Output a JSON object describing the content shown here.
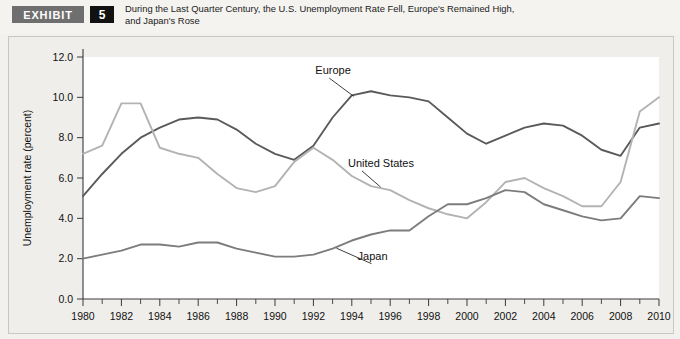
{
  "header": {
    "badge_label": "EXHIBIT",
    "exhibit_number": "5",
    "title_line1": "During the Last Quarter Century, the U.S. Unemployment Rate Fell, Europe's Remained High,",
    "title_line2": "and Japan's Rose"
  },
  "colors": {
    "europe": "#5a5a5a",
    "united_states": "#b3b3b3",
    "japan": "#7c7c7c",
    "axis": "#3a3a3a",
    "panel_bg": "#efeeea",
    "plot_bg": "#ffffff",
    "badge_gray": "#6f6f6f",
    "badge_black": "#111111"
  },
  "chart_data": {
    "type": "line",
    "title": "During the Last Quarter Century, the U.S. Unemployment Rate Fell, Europe's Remained High, and Japan's Rose",
    "xlabel": "",
    "ylabel": "Unemployment rate (percent)",
    "xlim": [
      1980,
      2010
    ],
    "ylim": [
      0.0,
      12.0
    ],
    "ytick_labels": [
      "0.0",
      "2.0",
      "4.0",
      "6.0",
      "8.0",
      "10.0",
      "12.0"
    ],
    "ytick_values": [
      0.0,
      2.0,
      4.0,
      6.0,
      8.0,
      10.0,
      12.0
    ],
    "xtick_labels": [
      "1980",
      "1982",
      "1984",
      "1986",
      "1988",
      "1990",
      "1992",
      "1994",
      "1996",
      "1998",
      "2000",
      "2002",
      "2004",
      "2006",
      "2008",
      "2010"
    ],
    "xtick_values": [
      1980,
      1982,
      1984,
      1986,
      1988,
      1990,
      1992,
      1994,
      1996,
      1998,
      2000,
      2002,
      2004,
      2006,
      2008,
      2010
    ],
    "x_minor_ticks": [
      1981,
      1983,
      1985,
      1987,
      1989,
      1991,
      1993,
      1995,
      1997,
      1999,
      2001,
      2003,
      2005,
      2007,
      2009
    ],
    "grid": false,
    "legend_position": "inline-annotations",
    "x": [
      1980,
      1981,
      1982,
      1983,
      1984,
      1985,
      1986,
      1987,
      1988,
      1989,
      1990,
      1991,
      1992,
      1993,
      1994,
      1995,
      1996,
      1997,
      1998,
      1999,
      2000,
      2001,
      2002,
      2003,
      2004,
      2005,
      2006,
      2007,
      2008,
      2009,
      2010
    ],
    "series": [
      {
        "name": "Europe",
        "color": "#5a5a5a",
        "values": [
          5.1,
          6.2,
          7.2,
          8.0,
          8.5,
          8.9,
          9.0,
          8.9,
          8.4,
          7.7,
          7.2,
          6.9,
          7.6,
          9.0,
          10.1,
          10.3,
          10.1,
          10.0,
          9.8,
          9.0,
          8.2,
          7.7,
          8.1,
          8.5,
          8.7,
          8.6,
          8.1,
          7.4,
          7.1,
          8.5,
          8.7
        ]
      },
      {
        "name": "United States",
        "color": "#b3b3b3",
        "values": [
          7.2,
          7.6,
          9.7,
          9.7,
          7.5,
          7.2,
          7.0,
          6.2,
          5.5,
          5.3,
          5.6,
          6.8,
          7.5,
          6.9,
          6.1,
          5.6,
          5.4,
          4.9,
          4.5,
          4.2,
          4.0,
          4.8,
          5.8,
          6.0,
          5.5,
          5.1,
          4.6,
          4.6,
          5.8,
          9.3,
          10.0
        ]
      },
      {
        "name": "Japan",
        "color": "#7c7c7c",
        "values": [
          2.0,
          2.2,
          2.4,
          2.7,
          2.7,
          2.6,
          2.8,
          2.8,
          2.5,
          2.3,
          2.1,
          2.1,
          2.2,
          2.5,
          2.9,
          3.2,
          3.4,
          3.4,
          4.1,
          4.7,
          4.7,
          5.0,
          5.4,
          5.3,
          4.7,
          4.4,
          4.1,
          3.9,
          4.0,
          5.1,
          5.0
        ]
      }
    ],
    "annotations": [
      {
        "text": "Europe",
        "series": "Europe",
        "label_x": 1992.1,
        "label_y": 11.15,
        "leader_to_x": 1994.1,
        "leader_to_y": 10.05
      },
      {
        "text": "United States",
        "series": "United States",
        "label_x": 1993.8,
        "label_y": 6.55,
        "leader_to_x": 1995.5,
        "leader_to_y": 5.55
      },
      {
        "text": "Japan",
        "series": "Japan",
        "label_x": 1994.3,
        "label_y": 1.95,
        "leader_to_x": 1993.2,
        "leader_to_y": 2.52
      }
    ]
  }
}
